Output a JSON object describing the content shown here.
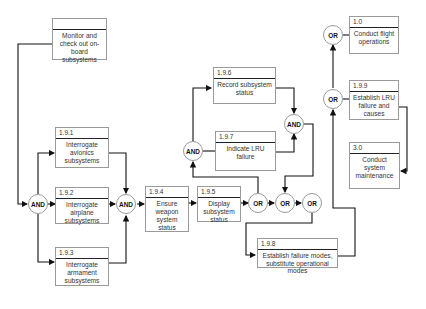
{
  "diagram": {
    "type": "functional flow block diagram",
    "blocks": [
      {
        "id": "monitor",
        "number": "",
        "label": "Monitor and check out on-board subsystems"
      },
      {
        "id": "b191",
        "number": "1.9.1",
        "label": "Interrogate avionics subsystems"
      },
      {
        "id": "b192",
        "number": "1.9.2",
        "label": "Interrogate airplane subsystems"
      },
      {
        "id": "b193",
        "number": "1.9.3",
        "label": "Interrogate armament subsystems"
      },
      {
        "id": "b194",
        "number": "1.9.4",
        "label": "Ensure weapon system status"
      },
      {
        "id": "b195",
        "number": "1.9.5",
        "label": "Display subsystem status"
      },
      {
        "id": "b196",
        "number": "1.9.6",
        "label": "Record subsystem status"
      },
      {
        "id": "b197",
        "number": "1.9.7",
        "label": "Indicate LRU failure"
      },
      {
        "id": "b198",
        "number": "1.9.8",
        "label": "Establish failure modes, substitute operational modes"
      },
      {
        "id": "b199",
        "number": "1.9.9",
        "label": "Establish LRU failure and causes"
      },
      {
        "id": "b10",
        "number": "1.0",
        "label": "Conduct flight operations"
      },
      {
        "id": "b30",
        "number": "3.0",
        "label": "Conduct system maintenance"
      }
    ],
    "gates": [
      {
        "id": "and1",
        "label": "AND"
      },
      {
        "id": "and2",
        "label": "AND"
      },
      {
        "id": "and3",
        "label": "AND"
      },
      {
        "id": "and4",
        "label": "AND"
      },
      {
        "id": "or1",
        "label": "OR"
      },
      {
        "id": "or2",
        "label": "OR"
      },
      {
        "id": "or3",
        "label": "OR"
      },
      {
        "id": "or4",
        "label": "OR"
      },
      {
        "id": "or5",
        "label": "OR"
      }
    ]
  }
}
